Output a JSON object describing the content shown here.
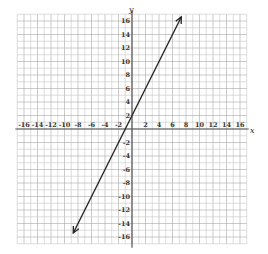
{
  "chart_data": {
    "type": "line",
    "title": "",
    "xlabel": "x",
    "ylabel": "y",
    "xlim": [
      -17,
      17
    ],
    "ylim": [
      -17,
      17
    ],
    "grid": true,
    "grid_minor_step": 1,
    "x_ticks": [
      -16,
      -14,
      -12,
      -10,
      -8,
      -6,
      -4,
      -2,
      2,
      4,
      6,
      8,
      10,
      12,
      14,
      16
    ],
    "y_ticks": [
      -16,
      -14,
      -12,
      -10,
      -8,
      -6,
      -4,
      -2,
      2,
      4,
      6,
      8,
      10,
      12,
      14,
      16
    ],
    "x_tick_labels": [
      "-16",
      "-14",
      "-12",
      "-10",
      "-8",
      "-6",
      "-4",
      "-2",
      "2",
      "4",
      "6",
      "8",
      "10",
      "12",
      "14",
      "16"
    ],
    "y_tick_labels": [
      "-16",
      "-14",
      "-12",
      "-10",
      "-8",
      "-6",
      "-4",
      "-2",
      "2",
      "4",
      "6",
      "8",
      "10",
      "12",
      "14",
      "16"
    ],
    "series": [
      {
        "name": "line",
        "equation": "y = 2x + 2",
        "slope": 2,
        "intercept": 2,
        "x": [
          -8.7,
          7.3
        ],
        "y": [
          -15.4,
          16.6
        ],
        "arrows": "both",
        "color": "#222222"
      }
    ]
  },
  "colors": {
    "grid_minor": "#c8c8c8",
    "grid_major": "#a8a8a8",
    "axis": "#555555",
    "line": "#222222"
  }
}
